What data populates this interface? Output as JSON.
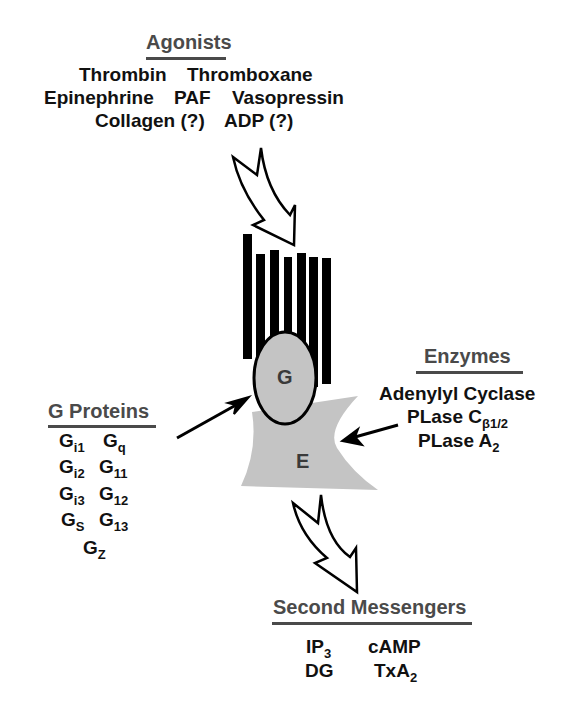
{
  "agonists": {
    "title": "Agonists",
    "rows": [
      [
        "Thrombin",
        "Thromboxane"
      ],
      [
        "Epinephrine",
        "PAF",
        "Vasopressin"
      ],
      [
        "Collagen (?)",
        "ADP (?)"
      ]
    ]
  },
  "receptor": {
    "g_label": "G",
    "e_label": "E",
    "colors": {
      "bars": "#000000",
      "fill": "#c4c4c4",
      "outline": "#000000"
    }
  },
  "g_proteins": {
    "title": "G Proteins",
    "items": [
      {
        "base": "G",
        "sub": "i1"
      },
      {
        "base": "G",
        "sub": "q"
      },
      {
        "base": "G",
        "sub": "i2"
      },
      {
        "base": "G",
        "sub": "11"
      },
      {
        "base": "G",
        "sub": "i3"
      },
      {
        "base": "G",
        "sub": "12"
      },
      {
        "base": "G",
        "sub": "S"
      },
      {
        "base": "G",
        "sub": "13"
      },
      {
        "base": "G",
        "sub": "Z"
      }
    ]
  },
  "enzymes": {
    "title": "Enzymes",
    "items": [
      {
        "base": "Adenylyl Cyclase",
        "sub": ""
      },
      {
        "base": "PLase C",
        "sub": "β1/2"
      },
      {
        "base": "PLase A",
        "sub": "2"
      }
    ]
  },
  "second_messengers": {
    "title": "Second Messengers",
    "items": [
      {
        "base": "IP",
        "sub": "3"
      },
      {
        "base": "cAMP",
        "sub": ""
      },
      {
        "base": "DG",
        "sub": ""
      },
      {
        "base": "TxA",
        "sub": "2"
      }
    ]
  }
}
